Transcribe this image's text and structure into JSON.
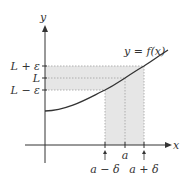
{
  "diagram": {
    "axes": {
      "x_label": "x",
      "y_label": "y"
    },
    "curve_label": "y = f(x)",
    "y_ticks": [
      {
        "label": "L + ε",
        "y": 66
      },
      {
        "label": "L",
        "y": 78
      },
      {
        "label": "L − ε",
        "y": 90
      }
    ],
    "x_ticks": [
      {
        "label": "a − δ",
        "x": 105
      },
      {
        "label": "a",
        "x": 125
      },
      {
        "label": "a + δ",
        "x": 144
      }
    ],
    "colors": {
      "band": "#e2e2e2",
      "curve": "#333333",
      "axis": "#333333",
      "dotted": "#999999"
    }
  }
}
